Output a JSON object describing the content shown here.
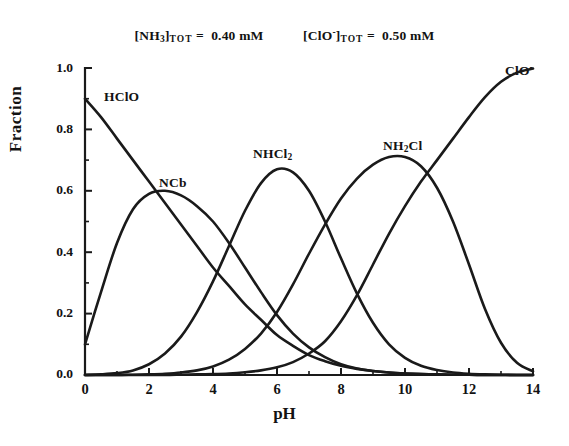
{
  "figure": {
    "name": "chloramine-speciation-diagram",
    "background_color": "#ffffff",
    "line_color": "#1a1a1a"
  },
  "conditions": [
    {
      "id": "ammonia-total",
      "species": "[NH",
      "species_sub": "3",
      "species_close": "]",
      "subscript": "TOT",
      "equals": "=",
      "value": "0.40",
      "unit": "mM",
      "full_text": "[NH3]TOT = 0.40 mM"
    },
    {
      "id": "hypochlorite-total",
      "species": "[ClO",
      "species_sup": "-",
      "species_close": "]",
      "subscript": "TOT",
      "equals": "=",
      "value": "0.50",
      "unit": "mM",
      "full_text": "[ClO-]TOT = 0.50 mM"
    }
  ],
  "axes": {
    "ylabel": "Fraction",
    "xlabel": "pH",
    "yticks": [
      "0.0",
      "0.2",
      "0.4",
      "0.6",
      "0.8",
      "1.0"
    ],
    "xticks": [
      "0",
      "2",
      "4",
      "6",
      "8",
      "10",
      "12",
      "14"
    ]
  },
  "curve_labels": [
    {
      "id": "hclo",
      "text": "HClO",
      "main": "HClO",
      "sub": "",
      "sup": ""
    },
    {
      "id": "ncl3",
      "text": "NCb",
      "main": "NCb",
      "sub": "",
      "sup": ""
    },
    {
      "id": "nhcl2",
      "text": "NHCl2",
      "main": "NHCl",
      "sub": "2",
      "sup": ""
    },
    {
      "id": "nh2cl",
      "text": "NH2Cl",
      "main": "NH",
      "sub": "2",
      "sup": "",
      "tail": "Cl"
    },
    {
      "id": "clo",
      "text": "ClO-",
      "main": "ClO",
      "sub": "",
      "sup": "-"
    }
  ],
  "chart_data": {
    "type": "line",
    "xlabel": "pH",
    "ylabel": "Fraction",
    "xlim": [
      0,
      14
    ],
    "ylim": [
      0.0,
      1.0
    ],
    "xticks": [
      0,
      2,
      4,
      6,
      8,
      10,
      12,
      14
    ],
    "xticks_minor": [
      1,
      3,
      5,
      7,
      9,
      11,
      13
    ],
    "yticks": [
      0.0,
      0.2,
      0.4,
      0.6,
      0.8,
      1.0
    ],
    "yticks_minor": [
      0.1,
      0.3,
      0.5,
      0.7,
      0.9
    ],
    "grid": false,
    "legend": "inline-curve-labels",
    "x": [
      0,
      0.5,
      1,
      1.5,
      2,
      2.5,
      3,
      3.5,
      4,
      4.5,
      5,
      5.5,
      6,
      6.5,
      7,
      7.5,
      8,
      8.5,
      9,
      9.5,
      10,
      10.5,
      11,
      11.5,
      12,
      12.5,
      13,
      13.5,
      14
    ],
    "series": [
      {
        "name": "HClO",
        "label": "HClO",
        "values": [
          0.9,
          0.84,
          0.77,
          0.7,
          0.63,
          0.56,
          0.49,
          0.42,
          0.35,
          0.29,
          0.23,
          0.18,
          0.13,
          0.095,
          0.065,
          0.045,
          0.03,
          0.02,
          0.013,
          0.008,
          0.005,
          0.003,
          0.002,
          0.001,
          0.001,
          0.0,
          0.0,
          0.0,
          0.0
        ]
      },
      {
        "name": "NCl3",
        "label": "NCb",
        "values": [
          0.1,
          0.27,
          0.43,
          0.54,
          0.59,
          0.6,
          0.585,
          0.55,
          0.5,
          0.43,
          0.35,
          0.27,
          0.195,
          0.135,
          0.09,
          0.058,
          0.035,
          0.021,
          0.013,
          0.008,
          0.005,
          0.003,
          0.002,
          0.001,
          0.001,
          0.0,
          0.0,
          0.0,
          0.0
        ]
      },
      {
        "name": "NHCl2",
        "label": "NHCl2",
        "values": [
          0.0,
          0.002,
          0.006,
          0.015,
          0.035,
          0.07,
          0.125,
          0.205,
          0.305,
          0.42,
          0.535,
          0.625,
          0.67,
          0.66,
          0.6,
          0.5,
          0.38,
          0.265,
          0.17,
          0.1,
          0.056,
          0.03,
          0.016,
          0.008,
          0.004,
          0.002,
          0.001,
          0.0,
          0.0
        ]
      },
      {
        "name": "NH2Cl",
        "label": "NH2Cl",
        "values": [
          0.0,
          0.0,
          0.0,
          0.001,
          0.002,
          0.004,
          0.008,
          0.015,
          0.028,
          0.05,
          0.085,
          0.135,
          0.205,
          0.295,
          0.395,
          0.49,
          0.575,
          0.64,
          0.685,
          0.71,
          0.71,
          0.68,
          0.61,
          0.5,
          0.36,
          0.215,
          0.105,
          0.04,
          0.012
        ]
      },
      {
        "name": "ClO-",
        "label": "ClO-",
        "values": [
          0.0,
          0.0,
          0.0,
          0.0,
          0.0,
          0.0,
          0.001,
          0.002,
          0.003,
          0.005,
          0.009,
          0.015,
          0.025,
          0.042,
          0.07,
          0.11,
          0.175,
          0.26,
          0.36,
          0.46,
          0.55,
          0.63,
          0.7,
          0.77,
          0.84,
          0.905,
          0.955,
          0.985,
          0.998
        ]
      }
    ]
  }
}
